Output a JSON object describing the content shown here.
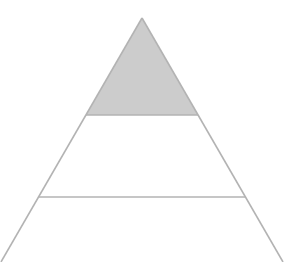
{
  "diagram": {
    "type": "pyramid",
    "levels": 3,
    "colors": {
      "background": "#ffffff",
      "stroke": "#b3b3b3",
      "highlight_fill": "#cccccc"
    },
    "geometry": {
      "apex": [
        142,
        18
      ],
      "base_left": [
        1,
        262
      ],
      "base_right": [
        283,
        262
      ],
      "dividers_y": [
        115,
        197
      ]
    },
    "tiers": [
      {
        "index": 0,
        "position": "top",
        "highlighted": true,
        "label": ""
      },
      {
        "index": 1,
        "position": "middle",
        "highlighted": false,
        "label": ""
      },
      {
        "index": 2,
        "position": "bottom",
        "highlighted": false,
        "label": ""
      }
    ]
  }
}
